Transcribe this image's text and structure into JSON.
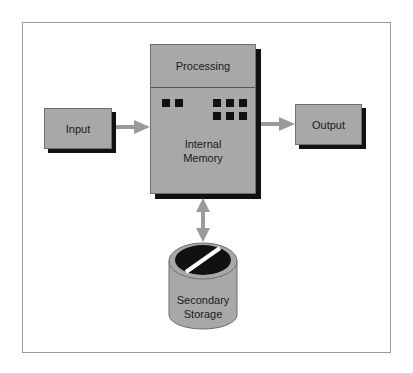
{
  "diagram": {
    "nodes": {
      "input": {
        "label": "Input"
      },
      "output": {
        "label": "Output"
      },
      "processing": {
        "label": "Processing"
      },
      "internal_memory": {
        "label_line1": "Internal",
        "label_line2": "Memory"
      },
      "secondary_storage": {
        "label_line1": "Secondary",
        "label_line2": "Storage"
      }
    },
    "edges": [
      {
        "from": "Input",
        "to": "Processing/Internal Memory",
        "direction": "one-way"
      },
      {
        "from": "Processing/Internal Memory",
        "to": "Output",
        "direction": "one-way"
      },
      {
        "from": "Processing/Internal Memory",
        "to": "Secondary Storage",
        "direction": "two-way"
      }
    ],
    "colors": {
      "box_fill": "#a8a8a8",
      "shadow": "#111111",
      "arrow": "#9a9a9a",
      "frame_border": "#9a9a9a",
      "disk_top": "#111111"
    }
  }
}
